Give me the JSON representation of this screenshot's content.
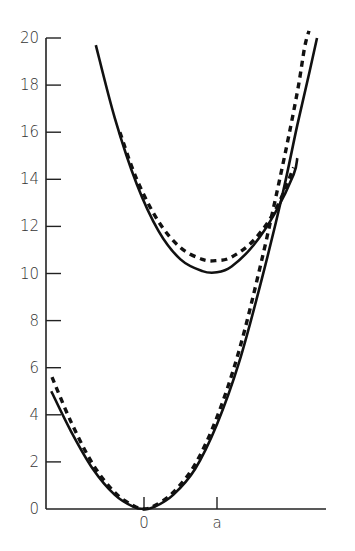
{
  "chart_data": {
    "type": "line",
    "title": "",
    "xlabel": "",
    "ylabel": "",
    "ylim": [
      0,
      20
    ],
    "grid": false,
    "legend": null,
    "y_ticks": [
      0,
      2,
      4,
      6,
      8,
      10,
      12,
      14,
      16,
      18,
      20
    ],
    "y_tick_labels": [
      "0",
      "2",
      "4",
      "6",
      "8",
      "10",
      "12",
      "14",
      "16",
      "18",
      "20"
    ],
    "x_ticks": [
      {
        "label": "0",
        "x": 0
      },
      {
        "label": "a",
        "x": 1
      }
    ],
    "x_range": [
      -1.34,
      2.49
    ],
    "series": [
      {
        "name": "lower-solid",
        "style": "solid",
        "points": [
          [
            -1.27,
            5.0
          ],
          [
            -1.0,
            3.3
          ],
          [
            -0.7,
            1.7
          ],
          [
            -0.4,
            0.6
          ],
          [
            -0.15,
            0.1
          ],
          [
            0,
            0
          ],
          [
            0.15,
            0.1
          ],
          [
            0.4,
            0.6
          ],
          [
            0.7,
            1.7
          ],
          [
            1.0,
            3.6
          ],
          [
            1.3,
            6.2
          ],
          [
            1.6,
            9.6
          ],
          [
            1.9,
            13.4
          ],
          [
            2.1,
            16.3
          ],
          [
            2.27,
            18.6
          ],
          [
            2.37,
            20.0
          ]
        ]
      },
      {
        "name": "lower-dashed",
        "style": "dashed",
        "points": [
          [
            -1.26,
            5.6
          ],
          [
            -1.0,
            3.7
          ],
          [
            -0.7,
            1.9
          ],
          [
            -0.4,
            0.7
          ],
          [
            -0.15,
            0.15
          ],
          [
            0,
            0
          ],
          [
            0.15,
            0.15
          ],
          [
            0.4,
            0.7
          ],
          [
            0.7,
            1.9
          ],
          [
            1.0,
            3.9
          ],
          [
            1.3,
            6.7
          ],
          [
            1.6,
            10.4
          ],
          [
            1.9,
            14.6
          ],
          [
            2.1,
            17.7
          ],
          [
            2.2,
            19.6
          ],
          [
            2.26,
            20.3
          ]
        ]
      },
      {
        "name": "upper-solid",
        "style": "solid",
        "points": [
          [
            -0.66,
            19.7
          ],
          [
            -0.4,
            16.6
          ],
          [
            -0.1,
            13.8
          ],
          [
            0.2,
            11.8
          ],
          [
            0.5,
            10.6
          ],
          [
            0.8,
            10.1
          ],
          [
            1.0,
            10.05
          ],
          [
            1.2,
            10.3
          ],
          [
            1.5,
            11.2
          ],
          [
            1.8,
            12.6
          ],
          [
            2.05,
            14.2
          ],
          [
            2.1,
            14.9
          ]
        ]
      },
      {
        "name": "upper-dashed",
        "style": "dashed",
        "points": [
          [
            -0.33,
            16.0
          ],
          [
            -0.1,
            14.0
          ],
          [
            0.2,
            12.2
          ],
          [
            0.5,
            11.1
          ],
          [
            0.8,
            10.6
          ],
          [
            1.0,
            10.55
          ],
          [
            1.2,
            10.7
          ],
          [
            1.5,
            11.4
          ],
          [
            1.8,
            12.7
          ],
          [
            2.05,
            14.5
          ]
        ]
      }
    ]
  }
}
